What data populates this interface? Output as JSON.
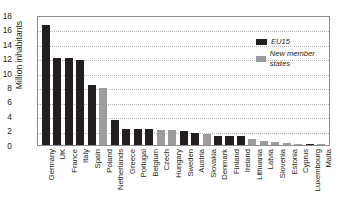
{
  "chart_data": {
    "type": "bar",
    "title": "",
    "subtitle": "",
    "xlabel": "",
    "ylabel": "Million inhabitants",
    "ylim": [
      0,
      18
    ],
    "yticks": [
      0,
      2,
      4,
      6,
      8,
      10,
      12,
      14,
      16,
      18
    ],
    "grid": true,
    "legend_position": "top-right",
    "categories": [
      "Germany",
      "UK",
      "France",
      "Italy",
      "Spain",
      "Poland",
      "Netherlands",
      "Greece",
      "Portugal",
      "Belgium",
      "Czech",
      "Hungary",
      "Sweden",
      "Austria",
      "Slovakia",
      "Denmark",
      "Finland",
      "Ireland",
      "Lithuania",
      "Latvia",
      "Slovenia",
      "Estonia",
      "Cyprus",
      "Luxembourg",
      "Malta"
    ],
    "values": [
      16.6,
      12.1,
      12.0,
      11.8,
      8.3,
      7.9,
      3.4,
      2.2,
      2.2,
      2.2,
      2.1,
      2.1,
      1.9,
      1.7,
      1.5,
      1.3,
      1.2,
      1.2,
      0.9,
      0.6,
      0.4,
      0.3,
      0.2,
      0.15,
      0.1
    ],
    "groups": [
      "EU15",
      "EU15",
      "EU15",
      "EU15",
      "EU15",
      "New member states",
      "EU15",
      "EU15",
      "EU15",
      "EU15",
      "New member states",
      "New member states",
      "EU15",
      "EU15",
      "New member states",
      "EU15",
      "EU15",
      "EU15",
      "New member states",
      "New member states",
      "New member states",
      "New member states",
      "New member states",
      "EU15",
      "New member states"
    ],
    "series": [
      {
        "name": "EU15",
        "color": "#231f20",
        "points": [
          {
            "category": "Germany",
            "value": 16.6
          },
          {
            "category": "UK",
            "value": 12.1
          },
          {
            "category": "France",
            "value": 12.0
          },
          {
            "category": "Italy",
            "value": 11.8
          },
          {
            "category": "Spain",
            "value": 8.3
          },
          {
            "category": "Netherlands",
            "value": 3.4
          },
          {
            "category": "Greece",
            "value": 2.2
          },
          {
            "category": "Portugal",
            "value": 2.2
          },
          {
            "category": "Belgium",
            "value": 2.2
          },
          {
            "category": "Sweden",
            "value": 1.9
          },
          {
            "category": "Austria",
            "value": 1.7
          },
          {
            "category": "Denmark",
            "value": 1.3
          },
          {
            "category": "Finland",
            "value": 1.2
          },
          {
            "category": "Ireland",
            "value": 1.2
          },
          {
            "category": "Luxembourg",
            "value": 0.15
          }
        ]
      },
      {
        "name": "New member states",
        "color": "#9c9c9c",
        "points": [
          {
            "category": "Poland",
            "value": 7.9
          },
          {
            "category": "Czech",
            "value": 2.1
          },
          {
            "category": "Hungary",
            "value": 2.1
          },
          {
            "category": "Slovakia",
            "value": 1.5
          },
          {
            "category": "Lithuania",
            "value": 0.9
          },
          {
            "category": "Latvia",
            "value": 0.6
          },
          {
            "category": "Slovenia",
            "value": 0.4
          },
          {
            "category": "Estonia",
            "value": 0.3
          },
          {
            "category": "Cyprus",
            "value": 0.2
          },
          {
            "category": "Malta",
            "value": 0.1
          }
        ]
      }
    ]
  },
  "legend": {
    "items": [
      {
        "label": "EU15",
        "color": "#231f20"
      },
      {
        "label": "New member states",
        "color": "#9c9c9c"
      }
    ]
  },
  "colors": {
    "eu15": "#231f20",
    "new_member_states": "#9c9c9c",
    "frame": "#8d8d8d",
    "grid": "#b5b5b5",
    "background": "#ffffff",
    "text": "#231f20"
  }
}
